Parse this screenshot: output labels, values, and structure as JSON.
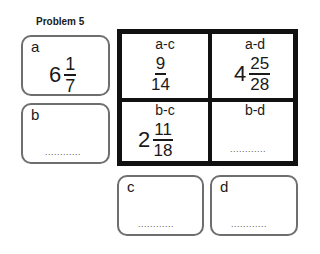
{
  "title": "Problem 5",
  "boxes": {
    "a": {
      "label": "a",
      "whole": "6",
      "num": "1",
      "den": "7"
    },
    "b": {
      "label": "b",
      "blank": "............"
    },
    "c": {
      "label": "c",
      "blank": "............"
    },
    "d": {
      "label": "d",
      "blank": "............"
    }
  },
  "grid": {
    "ac": {
      "label": "a-c",
      "num": "9",
      "den": "14"
    },
    "ad": {
      "label": "a-d",
      "whole": "4",
      "num": "25",
      "den": "28"
    },
    "bc": {
      "label": "b-c",
      "whole": "2",
      "num": "11",
      "den": "18"
    },
    "bd": {
      "label": "b-d",
      "blank": "............"
    }
  },
  "colors": {
    "box_border": "#6e6e6e",
    "grid_border": "#111111"
  }
}
